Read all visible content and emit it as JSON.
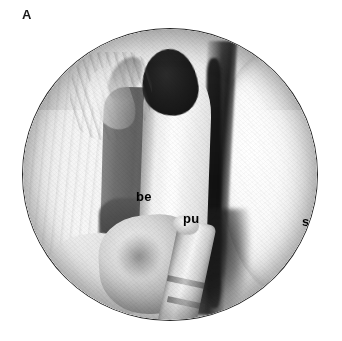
{
  "figure": {
    "panel_letter": "A",
    "type": "grayscale-anatomical-illustration",
    "view": "endoscopic circular field",
    "background_color": "#ffffff",
    "field_outline_color": "#262626"
  },
  "labels": [
    {
      "id": "be",
      "text": "be",
      "color": "#000000",
      "on_region": "dark gray column left of center"
    },
    {
      "id": "pu",
      "text": "pu",
      "color": "#000000",
      "on_region": "pale central tissue fold"
    },
    {
      "id": "s",
      "text": "s",
      "color": "#000000",
      "on_region": "bright rounded structure at right"
    }
  ],
  "signature": {
    "text": "Hinde",
    "style": "cursive artist signature",
    "color": "#5c5c5c"
  },
  "regions": {
    "left_wall": "pale striated tissue wall",
    "dark_cavity": "dark lumen opening at upper center",
    "right_cleft": "dark vertical cleft",
    "lower_instrument": "banded tubular instrument at lower center"
  }
}
